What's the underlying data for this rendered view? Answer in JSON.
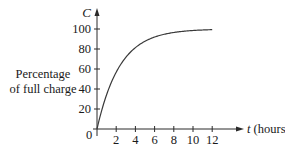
{
  "chart_data": {
    "type": "line",
    "title": "",
    "xlabel": "t (hours)",
    "x_var": "t",
    "x_unit": "(hours)",
    "ylabel": "Percentage of full charge",
    "ylabel_lines": [
      "Percentage",
      "of full charge"
    ],
    "y_var": "C",
    "origin_label": "0",
    "x_ticks": [
      2,
      4,
      6,
      8,
      10,
      12
    ],
    "y_ticks": [
      20,
      40,
      60,
      80,
      100
    ],
    "xlim": [
      0,
      14
    ],
    "ylim": [
      0,
      110
    ],
    "grid": false,
    "legend": null,
    "series": [
      {
        "name": "C(t)",
        "x": [
          0,
          1,
          2,
          3,
          4,
          5,
          6,
          7,
          8,
          9,
          10,
          11,
          12
        ],
        "values": [
          0,
          35,
          56,
          70,
          80,
          87,
          91,
          94,
          96,
          97,
          98,
          99,
          99.5
        ]
      }
    ]
  }
}
